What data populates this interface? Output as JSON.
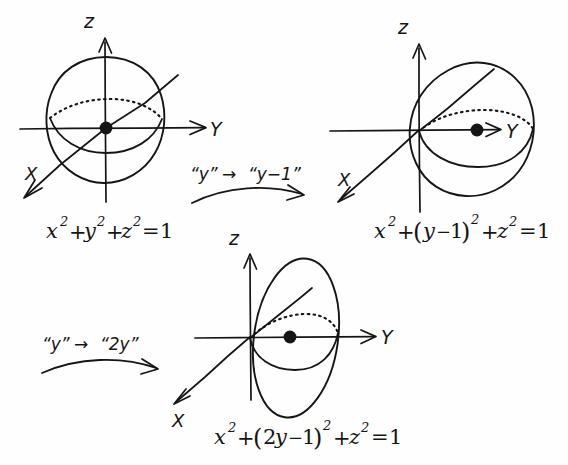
{
  "document": {
    "kind": "handwritten-math-notes",
    "medium": "scanned pen on white paper",
    "ink_color": "#151515",
    "paper_color": "#fefefe",
    "width": 568,
    "height": 465
  },
  "figures": [
    {
      "id": "figure-unit-sphere",
      "caption": "x² + y² + z² = 1",
      "shape": "sphere",
      "center_label": "origin",
      "axes": [
        {
          "name": "z",
          "label": "z",
          "direction": "up"
        },
        {
          "name": "y",
          "label": "Y",
          "direction": "right"
        },
        {
          "name": "x",
          "label": "X",
          "direction": "down-left"
        }
      ],
      "equation_parts": {
        "x_term": "x",
        "x_exp": "2",
        "plus1": "+",
        "y_term": "y",
        "y_exp": "2",
        "plus2": "+",
        "z_term": "z",
        "z_exp": "2",
        "equals": "=",
        "rhs": "1"
      },
      "dot_at": "origin"
    },
    {
      "id": "figure-shifted-sphere",
      "caption": "x² + (y−1)² + z² = 1",
      "shape": "sphere",
      "center_label": "y = 1",
      "axes": [
        {
          "name": "z",
          "label": "z",
          "direction": "up"
        },
        {
          "name": "y",
          "label": "Y",
          "direction": "right"
        },
        {
          "name": "x",
          "label": "X",
          "direction": "down-left"
        }
      ],
      "equation_parts": {
        "x_term": "x",
        "x_exp": "2",
        "plus1": "+",
        "paren_open": "(",
        "y_term": "y",
        "minus": "−",
        "one": "1",
        "paren_close": ")",
        "paren_exp": "2",
        "plus2": "+",
        "z_term": "z",
        "z_exp": "2",
        "equals": "=",
        "rhs": "1"
      },
      "dot_at": "sphere-center"
    },
    {
      "id": "figure-squashed-ellipsoid",
      "caption": "x² + (2y−1)² + z² = 1",
      "shape": "ellipsoid",
      "center_label": "y = 1/2",
      "axes": [
        {
          "name": "z",
          "label": "z",
          "direction": "up"
        },
        {
          "name": "y",
          "label": "Y",
          "direction": "right"
        },
        {
          "name": "x",
          "label": "X",
          "direction": "down-left"
        }
      ],
      "equation_parts": {
        "x_term": "x",
        "x_exp": "2",
        "plus1": "+",
        "paren_open": "(",
        "two": "2",
        "y_term": "y",
        "minus": "−",
        "one": "1",
        "paren_close": ")",
        "paren_exp": "2",
        "plus2": "+",
        "z_term": "z",
        "z_exp": "2",
        "equals": "=",
        "rhs": "1"
      },
      "dot_at": "ellipsoid-center"
    }
  ],
  "transformations": [
    {
      "id": "transform-shift",
      "from_label": "“y”",
      "arrow": "→",
      "to_label": "“y−1”",
      "between": [
        "figure-unit-sphere",
        "figure-shifted-sphere"
      ]
    },
    {
      "id": "transform-scale",
      "from_label": "“y”",
      "arrow": "→",
      "to_label": "“2y”",
      "between": [
        "figure-shifted-sphere",
        "figure-squashed-ellipsoid"
      ]
    }
  ]
}
